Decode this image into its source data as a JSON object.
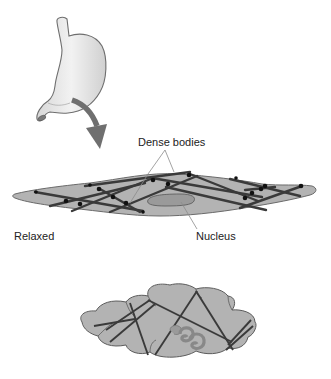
{
  "labels": {
    "dense_bodies": "Dense bodies",
    "nucleus": "Nucleus",
    "relaxed": "Relaxed"
  },
  "colors": {
    "stomach_fill": "#e6e6e6",
    "stomach_stroke": "#6e6e6e",
    "arrow": "#6f6f6f",
    "cell_fill": "#b3b3b3",
    "cell_stroke": "#6a6a6a",
    "filament": "#3a3a3a",
    "dense_body": "#111111",
    "nucleus_fill": "#9a9a9a",
    "leader_line": "#8c8c8c"
  },
  "panels": [
    {
      "id": "stomach",
      "description": "Stomach organ with arrow pointing to a smooth muscle cell"
    },
    {
      "id": "relaxed-cell",
      "description": "Elongated spindle-shaped relaxed smooth muscle cell with crisscrossing filaments and dense bodies"
    },
    {
      "id": "contracted-cell",
      "description": "Contracted, bulging smooth muscle cell with corkscrew nucleus"
    }
  ]
}
